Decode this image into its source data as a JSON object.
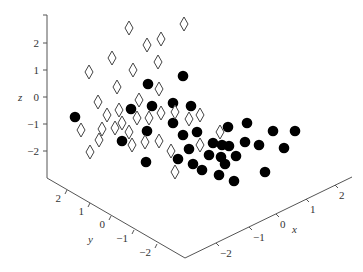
{
  "chart_data": {
    "type": "scatter",
    "dimensions": 3,
    "title": "",
    "xlabel": "x",
    "ylabel": "y",
    "zlabel": "z",
    "x_ticks": [
      "-2",
      "-1",
      "0",
      "1",
      "2"
    ],
    "y_ticks": [
      "-2",
      "-1",
      "0",
      "1",
      "2"
    ],
    "z_ticks": [
      "2",
      "1",
      "0",
      "-1",
      "-2"
    ],
    "xlim": [
      -3,
      3
    ],
    "ylim": [
      -3,
      3
    ],
    "zlim": [
      -3,
      3
    ],
    "grid": false,
    "legend": null,
    "series": [
      {
        "name": "class 1",
        "marker": "filled-circle",
        "color": "#000000",
        "screen_points": [
          [
            75,
            117
          ],
          [
            148,
            84
          ],
          [
            183,
            76
          ],
          [
            131,
            109
          ],
          [
            152,
            106
          ],
          [
            173,
            103
          ],
          [
            191,
            106
          ],
          [
            173,
            123
          ],
          [
            147,
            131
          ],
          [
            122,
            141
          ],
          [
            183,
            135
          ],
          [
            197,
            132
          ],
          [
            228,
            127
          ],
          [
            247,
            123
          ],
          [
            273,
            131
          ],
          [
            295,
            131
          ],
          [
            213,
            143
          ],
          [
            222,
            145
          ],
          [
            229,
            146
          ],
          [
            245,
            142
          ],
          [
            259,
            145
          ],
          [
            284,
            148
          ],
          [
            189,
            149
          ],
          [
            209,
            155
          ],
          [
            221,
            157
          ],
          [
            236,
            156
          ],
          [
            225,
            164
          ],
          [
            178,
            159
          ],
          [
            193,
            164
          ],
          [
            202,
            170
          ],
          [
            146,
            162
          ],
          [
            219,
            175
          ],
          [
            234,
            181
          ],
          [
            265,
            172
          ]
        ]
      },
      {
        "name": "class 2",
        "marker": "open-diamond",
        "color": "#000000",
        "screen_points": [
          [
            129,
            28
          ],
          [
            184,
            24
          ],
          [
            147,
            45
          ],
          [
            161,
            39
          ],
          [
            89,
            72
          ],
          [
            112,
            58
          ],
          [
            133,
            70
          ],
          [
            158,
            62
          ],
          [
            117,
            87
          ],
          [
            159,
            89
          ],
          [
            98,
            102
          ],
          [
            139,
            100
          ],
          [
            119,
            110
          ],
          [
            107,
            115
          ],
          [
            137,
            118
          ],
          [
            149,
            118
          ],
          [
            161,
            113
          ],
          [
            175,
            112
          ],
          [
            189,
            119
          ],
          [
            200,
            115
          ],
          [
            81,
            130
          ],
          [
            102,
            129
          ],
          [
            115,
            128
          ],
          [
            122,
            123
          ],
          [
            129,
            132
          ],
          [
            220,
            132
          ],
          [
            99,
            140
          ],
          [
            132,
            145
          ],
          [
            145,
            142
          ],
          [
            159,
            141
          ],
          [
            171,
            151
          ],
          [
            200,
            145
          ],
          [
            90,
            152
          ],
          [
            175,
            172
          ]
        ]
      }
    ]
  },
  "axes": {
    "z_axis": {
      "x": 47,
      "y_top": 15,
      "y_bottom": 178,
      "ticks": [
        {
          "label": "2",
          "y": 43
        },
        {
          "label": "1",
          "y": 70
        },
        {
          "label": "0",
          "y": 97
        },
        {
          "label": "-1",
          "y": 124
        },
        {
          "label": "-2",
          "y": 151
        }
      ]
    },
    "y_axis": {
      "from": [
        47,
        178
      ],
      "to": [
        185,
        258
      ],
      "ticks": [
        {
          "label": "2",
          "x": 67,
          "y": 190
        },
        {
          "label": "1",
          "x": 90,
          "y": 203
        },
        {
          "label": "0",
          "x": 111,
          "y": 216
        },
        {
          "label": "-1",
          "x": 134,
          "y": 230
        },
        {
          "label": "-2",
          "x": 157,
          "y": 244
        }
      ]
    },
    "x_axis": {
      "from": [
        185,
        258
      ],
      "to": [
        352,
        177
      ],
      "ticks": [
        {
          "label": "-2",
          "x": 216,
          "y": 243
        },
        {
          "label": "-1",
          "x": 249,
          "y": 227
        },
        {
          "label": "0",
          "x": 276,
          "y": 214
        },
        {
          "label": "1",
          "x": 306,
          "y": 199
        },
        {
          "label": "2",
          "x": 335,
          "y": 185
        }
      ]
    }
  }
}
